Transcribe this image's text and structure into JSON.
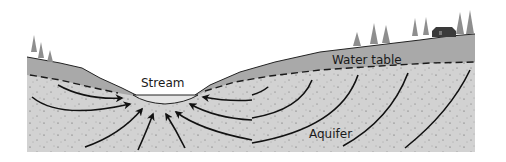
{
  "diagram": {
    "labels": {
      "stream": "Stream",
      "water_table": "Water table",
      "aquifer": "Aquifer"
    },
    "colors": {
      "background": "#ffffff",
      "unsaturated_zone": "#a9a9a9",
      "aquifer": "#d2d2d2",
      "stream_water": "#e4e4e4",
      "tree": "#8e8e8e",
      "house": "#3a3a3a",
      "flow_line": "#111111",
      "water_table_line": "#1a1a1a"
    },
    "elements": [
      "land-surface",
      "unsaturated-zone",
      "water-table-dashed-line",
      "aquifer",
      "stream",
      "groundwater-flow-arrows",
      "trees",
      "house"
    ]
  }
}
